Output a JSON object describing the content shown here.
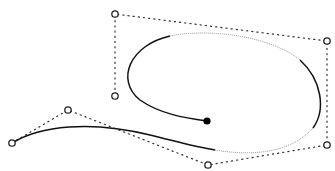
{
  "diagram": {
    "control_points": [
      {
        "x": 12,
        "y": 143
      },
      {
        "x": 68,
        "y": 110
      },
      {
        "x": 208,
        "y": 165
      },
      {
        "x": 327,
        "y": 145
      },
      {
        "x": 327,
        "y": 41
      },
      {
        "x": 115,
        "y": 14
      },
      {
        "x": 115,
        "y": 96
      }
    ],
    "end_point": {
      "x": 207,
      "y": 121
    },
    "colors": {
      "curve": "#111111",
      "curve_light": "#999999",
      "polygon": "#333333",
      "background": "#ffffff"
    }
  }
}
